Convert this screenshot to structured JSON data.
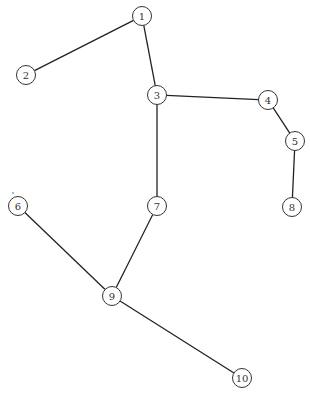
{
  "diagram": {
    "type": "graph",
    "node_radius": 9.5,
    "nodes": [
      {
        "id": "1",
        "label": "1",
        "x": 142,
        "y": 16
      },
      {
        "id": "2",
        "label": "2",
        "x": 26,
        "y": 75
      },
      {
        "id": "3",
        "label": "3",
        "x": 157,
        "y": 95
      },
      {
        "id": "4",
        "label": "4",
        "x": 268,
        "y": 100
      },
      {
        "id": "5",
        "label": "5",
        "x": 295,
        "y": 141
      },
      {
        "id": "6",
        "label": "6",
        "x": 18,
        "y": 206
      },
      {
        "id": "7",
        "label": "7",
        "x": 157,
        "y": 206
      },
      {
        "id": "8",
        "label": "8",
        "x": 292,
        "y": 207
      },
      {
        "id": "9",
        "label": "9",
        "x": 112,
        "y": 296
      },
      {
        "id": "10",
        "label": "10",
        "x": 242,
        "y": 378
      }
    ],
    "edges": [
      {
        "from": "1",
        "to": "2"
      },
      {
        "from": "1",
        "to": "3"
      },
      {
        "from": "3",
        "to": "4"
      },
      {
        "from": "4",
        "to": "5"
      },
      {
        "from": "5",
        "to": "8"
      },
      {
        "from": "3",
        "to": "7"
      },
      {
        "from": "7",
        "to": "9"
      },
      {
        "from": "6",
        "to": "9"
      },
      {
        "from": "9",
        "to": "10"
      }
    ]
  }
}
